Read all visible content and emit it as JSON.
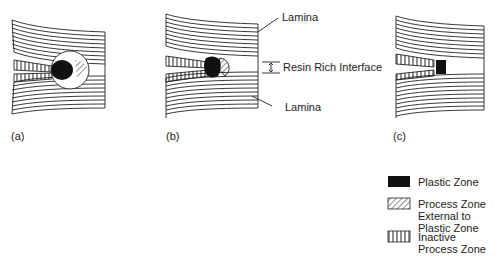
{
  "figure": {
    "panels": [
      {
        "id": "a",
        "label": "(a)"
      },
      {
        "id": "b",
        "label": "(b)"
      },
      {
        "id": "c",
        "label": "(c)"
      }
    ],
    "annotations": {
      "lamina_top": "Lamina",
      "resin_rich_interface": "Resin Rich Interface",
      "lamina_bottom": "Lamina"
    },
    "legend": [
      {
        "key": "plastic",
        "label": "Plastic Zone",
        "pattern": "solid-black"
      },
      {
        "key": "process",
        "label": "Process Zone\nExternal to\nPlastic Zone",
        "pattern": "diagonal-hatch"
      },
      {
        "key": "inactive",
        "label": "Inactive\nProcess Zone",
        "pattern": "vertical-hatch"
      }
    ],
    "colors": {
      "ink": "#1a1a1a",
      "background": "#ffffff"
    }
  }
}
